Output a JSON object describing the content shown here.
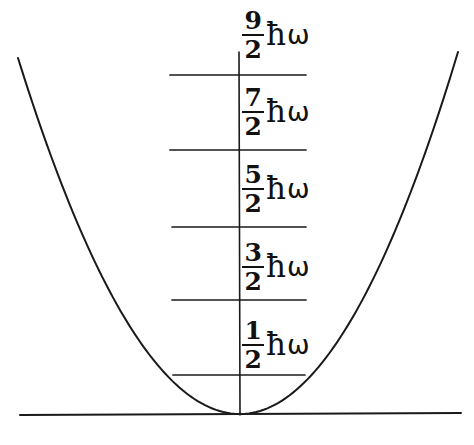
{
  "figure": {
    "kind": "quantum-harmonic-oscillator-energy-level-diagram",
    "background_color": "#ffffff",
    "ink_color": "#1a1a1a",
    "width": 474,
    "height": 445
  },
  "axes": {
    "baseline": {
      "name": "x-axis-baseline",
      "x1": 20,
      "y1": 415,
      "x2": 461,
      "y2": 413
    },
    "vertical": {
      "name": "energy-axis",
      "x1": 239,
      "y1": 52,
      "x2": 240,
      "y2": 415
    }
  },
  "potential": {
    "type": "parabola",
    "vertex_x": 240,
    "vertex_y": 414,
    "left_end": {
      "x": 18,
      "y": 58
    },
    "right_end": {
      "x": 458,
      "y": 52
    }
  },
  "levels": [
    {
      "n": 4,
      "label_numerator": "9",
      "label_denominator": "2",
      "hbar": "ħ",
      "omega": "ω",
      "line": {
        "x1": 170,
        "y": 75,
        "x2": 306
      },
      "label_x": 242,
      "label_y": 8
    },
    {
      "n": 3,
      "label_numerator": "7",
      "label_denominator": "2",
      "hbar": "ħ",
      "omega": "ω",
      "line": {
        "x1": 170,
        "y": 150,
        "x2": 306
      },
      "label_x": 242,
      "label_y": 85
    },
    {
      "n": 2,
      "label_numerator": "5",
      "label_denominator": "2",
      "hbar": "ħ",
      "omega": "ω",
      "line": {
        "x1": 172,
        "y": 227,
        "x2": 306
      },
      "label_x": 242,
      "label_y": 162
    },
    {
      "n": 1,
      "label_numerator": "3",
      "label_denominator": "2",
      "hbar": "ħ",
      "omega": "ω",
      "line": {
        "x1": 172,
        "y": 300,
        "x2": 306
      },
      "label_x": 242,
      "label_y": 240
    },
    {
      "n": 0,
      "label_numerator": "1",
      "label_denominator": "2",
      "hbar": "ħ",
      "omega": "ω",
      "line": {
        "x1": 173,
        "y": 375,
        "x2": 305
      },
      "label_x": 242,
      "label_y": 318
    }
  ],
  "chart_data": {
    "type": "line",
    "title": "",
    "xlabel": "",
    "ylabel": "",
    "annotations": [
      "9/2 ħω",
      "7/2 ħω",
      "5/2 ħω",
      "3/2 ħω",
      "1/2 ħω"
    ],
    "series": [
      {
        "name": "harmonic potential V(x) = (1/2) m ω² x²",
        "x": [
          -1.0,
          -0.8,
          -0.6,
          -0.4,
          -0.2,
          0.0,
          0.2,
          0.4,
          0.6,
          0.8,
          1.0
        ],
        "values": [
          4.9,
          3.14,
          1.76,
          0.78,
          0.2,
          0.0,
          0.2,
          0.78,
          1.76,
          3.14,
          4.9
        ]
      }
    ],
    "energy_levels": {
      "name": "quantized energy eigenvalues",
      "unit": "ħω",
      "values": [
        0.5,
        1.5,
        2.5,
        3.5,
        4.5
      ],
      "labels": [
        "1/2 ħω",
        "3/2 ħω",
        "5/2 ħω",
        "7/2 ħω",
        "9/2 ħω"
      ]
    },
    "ylim": [
      0,
      5
    ],
    "xlim": [
      -1.05,
      1.05
    ],
    "grid": false,
    "legend": "none"
  }
}
